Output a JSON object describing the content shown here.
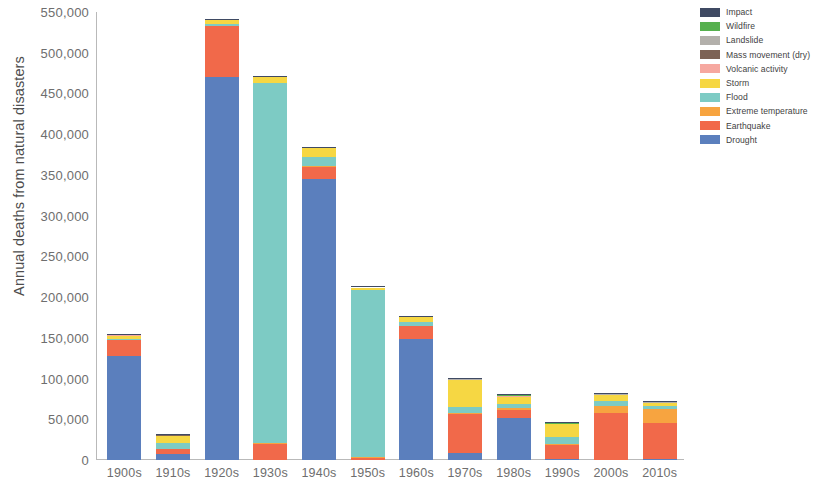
{
  "chart_data": {
    "type": "bar",
    "stacked": true,
    "title": "",
    "xlabel": "",
    "ylabel": "Annual deaths from natural disasters",
    "ylim": [
      0,
      550000
    ],
    "ytick_step": 50000,
    "grid": false,
    "legend_position": "top-right",
    "ytick_labels": [
      "550,000",
      "500,000",
      "450,000",
      "400,000",
      "350,000",
      "300,000",
      "250,000",
      "200,000",
      "150,000",
      "100,000",
      "50,000",
      "0"
    ],
    "ytick_values": [
      550000,
      500000,
      450000,
      400000,
      350000,
      300000,
      250000,
      200000,
      150000,
      100000,
      50000,
      0
    ],
    "categories": [
      "1900s",
      "1910s",
      "1920s",
      "1930s",
      "1940s",
      "1950s",
      "1960s",
      "1970s",
      "1980s",
      "1990s",
      "2000s",
      "2010s"
    ],
    "series": [
      {
        "name": "Drought",
        "color": "#5b7fbd",
        "values": [
          128000,
          7500,
          470000,
          0,
          345000,
          0,
          148000,
          9000,
          51000,
          1500,
          600,
          1200
        ]
      },
      {
        "name": "Earthquake",
        "color": "#f1694a",
        "values": [
          19000,
          5500,
          63000,
          20000,
          15000,
          3000,
          16000,
          48000,
          11000,
          16500,
          57000,
          44000
        ]
      },
      {
        "name": "Extreme temperature",
        "color": "#f7a440",
        "values": [
          400,
          300,
          400,
          400,
          500,
          300,
          600,
          1200,
          1500,
          1800,
          9000,
          17000
        ]
      },
      {
        "name": "Flood",
        "color": "#7dcbc4",
        "values": [
          1000,
          8000,
          1500,
          442000,
          12000,
          205000,
          5000,
          6500,
          5500,
          8500,
          5500,
          4500
        ]
      },
      {
        "name": "Storm",
        "color": "#f6d743",
        "values": [
          4000,
          8500,
          5000,
          7500,
          10000,
          3500,
          5500,
          33500,
          8500,
          15500,
          7500,
          3500
        ]
      },
      {
        "name": "Volcanic activity",
        "color": "#f6a8a0",
        "values": [
          800,
          200,
          200,
          200,
          200,
          100,
          200,
          300,
          700,
          200,
          200,
          200
        ]
      },
      {
        "name": "Mass movement (dry)",
        "color": "#7d6355",
        "values": [
          100,
          100,
          100,
          100,
          100,
          100,
          100,
          200,
          200,
          150,
          150,
          100
        ]
      },
      {
        "name": "Landslide",
        "color": "#b3b0ab",
        "values": [
          200,
          200,
          200,
          300,
          300,
          200,
          400,
          600,
          700,
          600,
          800,
          700
        ]
      },
      {
        "name": "Wildfire",
        "color": "#56b04e",
        "values": [
          100,
          100,
          100,
          100,
          100,
          100,
          100,
          100,
          200,
          150,
          150,
          150
        ]
      },
      {
        "name": "Impact",
        "color": "#3f4a63",
        "values": [
          50,
          50,
          50,
          50,
          50,
          50,
          50,
          50,
          50,
          50,
          50,
          50
        ]
      }
    ],
    "stack_order_bottom_to_top": [
      "Drought",
      "Earthquake",
      "Extreme temperature",
      "Flood",
      "Storm",
      "Volcanic activity",
      "Mass movement (dry)",
      "Landslide",
      "Wildfire",
      "Impact"
    ],
    "totals": [
      153650,
      30450,
      540550,
      470650,
      383250,
      212350,
      175950,
      99450,
      79350,
      44950,
      80950,
      71400
    ]
  },
  "legend": {
    "items": [
      {
        "label": "Impact",
        "color": "#3f4a63"
      },
      {
        "label": "Wildfire",
        "color": "#56b04e"
      },
      {
        "label": "Landslide",
        "color": "#b3b0ab"
      },
      {
        "label": "Mass movement (dry)",
        "color": "#7d6355"
      },
      {
        "label": "Volcanic activity",
        "color": "#f6a8a0"
      },
      {
        "label": "Storm",
        "color": "#f6d743"
      },
      {
        "label": "Flood",
        "color": "#7dcbc4"
      },
      {
        "label": "Extreme temperature",
        "color": "#f7a440"
      },
      {
        "label": "Earthquake",
        "color": "#f1694a"
      },
      {
        "label": "Drought",
        "color": "#5b7fbd"
      }
    ]
  }
}
